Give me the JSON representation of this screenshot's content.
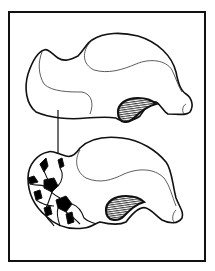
{
  "figure": {
    "type": "line-illustration",
    "panels": [
      {
        "name": "intact-bone",
        "position": "top"
      },
      {
        "name": "fractured-bone",
        "position": "bottom"
      }
    ],
    "annotations": [
      {
        "type": "arrow",
        "direction": "down",
        "from": "intact-bone",
        "to": "fractured-bone"
      }
    ],
    "colors": {
      "line": "#111111",
      "fill": "#ffffff",
      "fragment_fill": "#000000",
      "background": "#ffffff"
    }
  }
}
